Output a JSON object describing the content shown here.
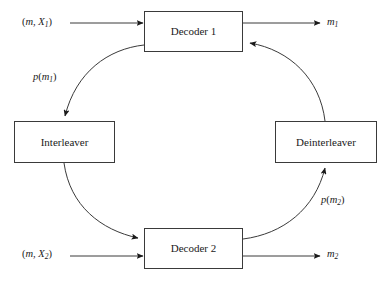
{
  "diagram": {
    "type": "block-diagram",
    "stroke_color": "#3a3a3a",
    "text_color": "#1a1a1a",
    "background": "#ffffff",
    "nodes": [
      {
        "id": "decoder1",
        "label": "Decoder 1",
        "x": 144,
        "y": 11,
        "w": 99,
        "h": 41
      },
      {
        "id": "decoder2",
        "label": "Decoder 2",
        "x": 144,
        "y": 228,
        "w": 99,
        "h": 41
      },
      {
        "id": "interleaver",
        "label": "Interleaver",
        "x": 14,
        "y": 121,
        "w": 101,
        "h": 42
      },
      {
        "id": "deinterleaver",
        "label": "Deinterleaver",
        "x": 275,
        "y": 121,
        "w": 102,
        "h": 42
      }
    ],
    "io_labels": [
      {
        "id": "input-1",
        "base": "(m, X",
        "sub": "1",
        "tail": ")",
        "x": 22,
        "y": 17
      },
      {
        "id": "input-2",
        "base": "(m, X",
        "sub": "2",
        "tail": ")",
        "x": 22,
        "y": 249
      },
      {
        "id": "output-1",
        "base": "m",
        "sub": "1",
        "tail": "",
        "x": 327,
        "y": 17
      },
      {
        "id": "output-2",
        "base": "m",
        "sub": "2",
        "tail": "",
        "x": 327,
        "y": 249
      },
      {
        "id": "extrinsic-1",
        "base": "p(m",
        "sub": "1",
        "tail": ")",
        "x": 33,
        "y": 72
      },
      {
        "id": "extrinsic-2",
        "base": "p(m",
        "sub": "2",
        "tail": ")",
        "x": 321,
        "y": 195
      }
    ],
    "edges": [
      {
        "id": "edge-input1-decoder1",
        "kind": "straight",
        "from": "input-1",
        "to": "decoder1"
      },
      {
        "id": "edge-decoder1-output1",
        "kind": "straight",
        "from": "decoder1",
        "to": "output-1"
      },
      {
        "id": "edge-input2-decoder2",
        "kind": "straight",
        "from": "input-2",
        "to": "decoder2"
      },
      {
        "id": "edge-decoder2-output2",
        "kind": "straight",
        "from": "decoder2",
        "to": "output-2"
      },
      {
        "id": "edge-decoder1-interleaver",
        "kind": "curve",
        "from": "decoder1",
        "to": "interleaver"
      },
      {
        "id": "edge-interleaver-decoder2",
        "kind": "curve",
        "from": "interleaver",
        "to": "decoder2"
      },
      {
        "id": "edge-decoder2-deinterleaver",
        "kind": "curve",
        "from": "decoder2",
        "to": "deinterleaver"
      },
      {
        "id": "edge-deinterleaver-decoder1",
        "kind": "curve",
        "from": "deinterleaver",
        "to": "decoder1"
      }
    ]
  }
}
